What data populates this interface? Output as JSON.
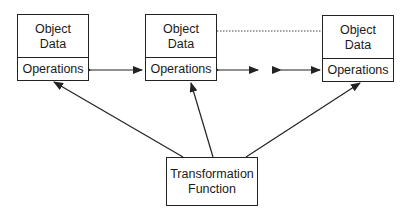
{
  "objects": [
    {
      "data_line1": "Object",
      "data_line2": "Data",
      "operations": "Operations"
    },
    {
      "data_line1": "Object",
      "data_line2": "Data",
      "operations": "Operations"
    },
    {
      "data_line1": "Object",
      "data_line2": "Data",
      "operations": "Operations"
    }
  ],
  "transformation": {
    "line1": "Transformation",
    "line2": "Function"
  },
  "colors": {
    "stroke": "#222222",
    "background": "#ffffff"
  }
}
